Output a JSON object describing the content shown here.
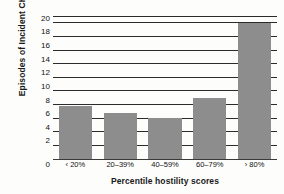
{
  "chart_data": {
    "type": "bar",
    "title": "",
    "subtitle": "",
    "xlabel": "Percentile hostility scores",
    "ylabel": "Episodes of Incident CHD",
    "categories": [
      "‹ 20%",
      "20–39%",
      "40–59%",
      "60–79%",
      "› 80%"
    ],
    "values": [
      7.8,
      6.8,
      6.0,
      9.0,
      20.0
    ],
    "ylim": [
      0,
      21
    ],
    "yticks": [
      0,
      2,
      4,
      6,
      8,
      10,
      12,
      14,
      16,
      18,
      20
    ],
    "ytick_labels": [
      "0",
      "2",
      "4",
      "6",
      "8",
      "10",
      "12",
      "14",
      "16",
      "18",
      "20"
    ],
    "grid": true,
    "legend": false,
    "legend_position": "none",
    "bar_color": "#8d8d8d",
    "grid_color": "#2b2b2b",
    "axis_color": "#3a3a3a",
    "text_color": "#111111"
  }
}
